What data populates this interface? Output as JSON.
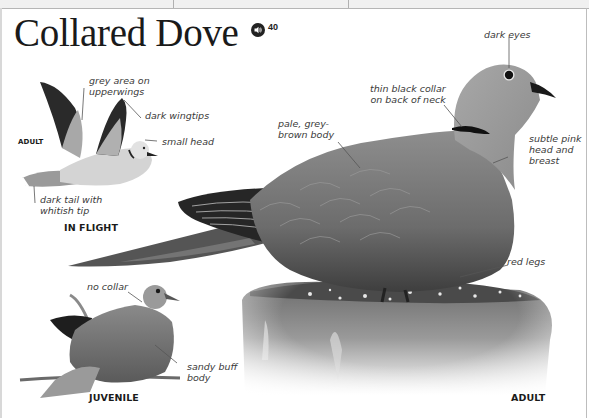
{
  "header": {
    "title": "Collared Dove",
    "audio_icon": "speaker-icon",
    "audio_track": "40"
  },
  "sections": {
    "in_flight": {
      "caption": "IN FLIGHT",
      "age_label": "ADULT",
      "annotations": [
        "grey area on upperwings",
        "dark wingtips",
        "small head",
        "dark tail with whitish tip"
      ]
    },
    "adult": {
      "caption": "ADULT",
      "annotations": [
        "dark eyes",
        "thin black collar on back of neck",
        "pale, grey-brown body",
        "subtle pink head and breast",
        "red legs"
      ]
    },
    "juvenile": {
      "caption": "JUVENILE",
      "annotations": [
        "no collar",
        "sandy buff body"
      ]
    }
  },
  "labels": {
    "grey_area_1": "grey area on",
    "grey_area_2": "upperwings",
    "dark_wingtips": "dark wingtips",
    "small_head": "small head",
    "dark_tail_1": "dark tail with",
    "dark_tail_2": "whitish tip",
    "dark_eyes": "dark eyes",
    "collar_1": "thin black collar",
    "collar_2": "on back of neck",
    "body_1": "pale, grey-",
    "body_2": "brown body",
    "pink_1": "subtle pink",
    "pink_2": "head and",
    "pink_3": "breast",
    "red_legs": "red legs",
    "no_collar": "no collar",
    "sandy_1": "sandy buff",
    "sandy_2": "body"
  },
  "colors": {
    "text": "#1a1a1a",
    "annotation": "#3a3a3a",
    "leader_line": "#555555",
    "background": "#ffffff"
  }
}
